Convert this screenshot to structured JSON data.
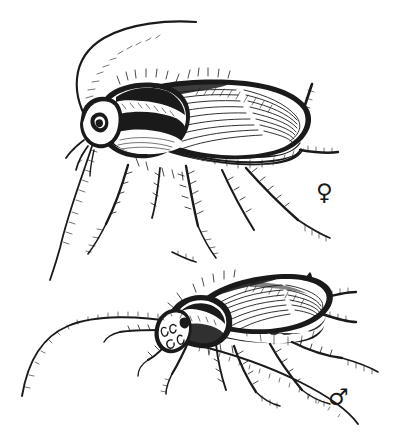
{
  "plate": {
    "title": "Cockroach sexual dimorphism plate",
    "medium": "pen-and-ink line illustration",
    "background_color": "#ffffff",
    "ink_color": "#1a1a1a",
    "width_px": 400,
    "height_px": 435,
    "border": "none",
    "caption_text": "",
    "subject": "two cockroaches shown in lateral view"
  },
  "figures": [
    {
      "id": "female",
      "label_symbol": "♀",
      "symbol_name": "venus-symbol",
      "position": "upper",
      "orientation": "lateral, facing left",
      "body_bounds_px": {
        "x": 80,
        "y": 78,
        "width": 232,
        "height": 95
      },
      "features": {
        "pronotum": "broad shield with two bold dark bands and pale median margin",
        "wings": "long tegmina with dense longitudinal vein hatching, covering abdomen, rounded at tip",
        "abdomen": "segmented, pale plates visible beneath wing margin",
        "cerci": "two segmented cerci projecting from rear",
        "antennae": "two long filiform segmented antennae, one arcing up and right, one sweeping down-left",
        "legs": "six spined legs with tarsal segments and claws",
        "eyes": "dark compound eye at head"
      }
    },
    {
      "id": "male",
      "label_symbol": "♂",
      "symbol_name": "mars-symbol",
      "position": "lower",
      "orientation": "lateral, facing left",
      "body_bounds_px": {
        "x": 165,
        "y": 272,
        "width": 185,
        "height": 80
      },
      "features": {
        "pronotum": "dark shield, narrower than female",
        "wings": "slender tegmina with vein hatching and upturned pointed tip",
        "abdomen": "narrow, segmented with mottled pale blotches along margin",
        "cerci": "two segmented cerci projecting from rear",
        "antennae": "two very long filiform segmented antennae sweeping far to the left and down",
        "legs": "six spined legs, slender, with tarsal segments",
        "head": "pale head with mouthparts and maxillary palps"
      }
    }
  ],
  "legend": {
    "female_symbol": "♀",
    "male_symbol": "♂",
    "female_symbol_position_px": {
      "x": 326,
      "y": 194
    },
    "male_symbol_position_px": {
      "x": 339,
      "y": 398
    }
  }
}
